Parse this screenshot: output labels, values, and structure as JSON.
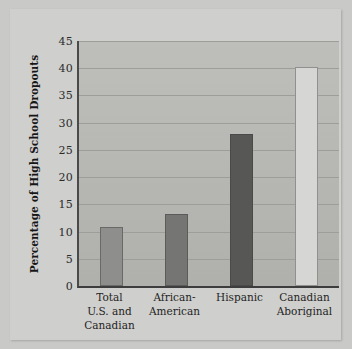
{
  "chart_data": {
    "type": "bar",
    "title": "",
    "subtitle": "",
    "xlabel": "",
    "ylabel": "Percentage of High School Dropouts",
    "categories": [
      "Total\nU.S. and\nCanadian",
      "African-\nAmerican",
      "Hispanic",
      "Canadian\nAboriginal"
    ],
    "category_lines": [
      [
        "Total",
        "U.S. and",
        "Canadian"
      ],
      [
        "African-",
        "American"
      ],
      [
        "Hispanic"
      ],
      [
        "Canadian",
        "Aboriginal"
      ]
    ],
    "values": [
      10.8,
      13.3,
      28.0,
      40.3
    ],
    "ylim": [
      0,
      45
    ],
    "yticks": [
      0,
      5,
      10,
      15,
      20,
      25,
      30,
      35,
      40,
      45
    ],
    "ytick_labels": [
      "0",
      "5",
      "10",
      "15",
      "20",
      "25",
      "30",
      "35",
      "40",
      "45"
    ],
    "grid": true,
    "legend": "none",
    "bar_colors": [
      "#8e8e8c",
      "#757573",
      "#575755",
      "#d6d6d4"
    ],
    "plot_background": "#b9b9b6",
    "figure_background": "#c9c9c7",
    "panel_background": "#cfcfcd",
    "gridline_color": "#9d9d9a",
    "axis_color": "#3d3d3d",
    "text_color": "#1f1f1f"
  }
}
